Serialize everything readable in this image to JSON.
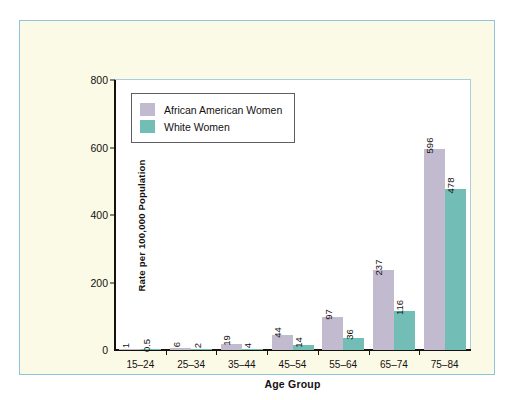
{
  "chart_data": {
    "type": "bar",
    "title": "",
    "xlabel": "Age Group",
    "ylabel": "Rate per 100,000 Population",
    "categories": [
      "15–24",
      "25–34",
      "35–44",
      "45–54",
      "55–64",
      "65–74",
      "75–84"
    ],
    "series": [
      {
        "name": "African American Women",
        "color": "#c2bace",
        "values": [
          1,
          6,
          19,
          44,
          97,
          237,
          596
        ],
        "value_labels": [
          "1",
          "6",
          "19",
          "44",
          "97",
          "237",
          "596"
        ]
      },
      {
        "name": "White Women",
        "color": "#72bdb6",
        "values": [
          0.5,
          2,
          4,
          14,
          36,
          116,
          478
        ],
        "value_labels": [
          "0.5",
          "2",
          "4",
          "14",
          "36",
          "116",
          "478"
        ]
      }
    ],
    "ylim": [
      0,
      800
    ],
    "yticks": [
      0,
      200,
      400,
      600,
      800
    ],
    "ytick_labels": [
      "0",
      "200",
      "400",
      "600",
      "800"
    ],
    "grid": false,
    "legend_position": "upper-left"
  },
  "legend": {
    "entries": [
      {
        "label": "African American Women",
        "color": "#c2bace"
      },
      {
        "label": "White Women",
        "color": "#72bdb6"
      }
    ]
  },
  "colors": {
    "page_background": "#ffffff",
    "panel_background": "#fbfae6",
    "panel_border": "#8fc5d8",
    "plot_background": "#ffffff",
    "plot_border": "#a8cfe0",
    "axis": "#14110f",
    "text": "#14110f",
    "series_african_american": "#c2bace",
    "series_white": "#72bdb6",
    "legend_border": "#5d5d63"
  }
}
